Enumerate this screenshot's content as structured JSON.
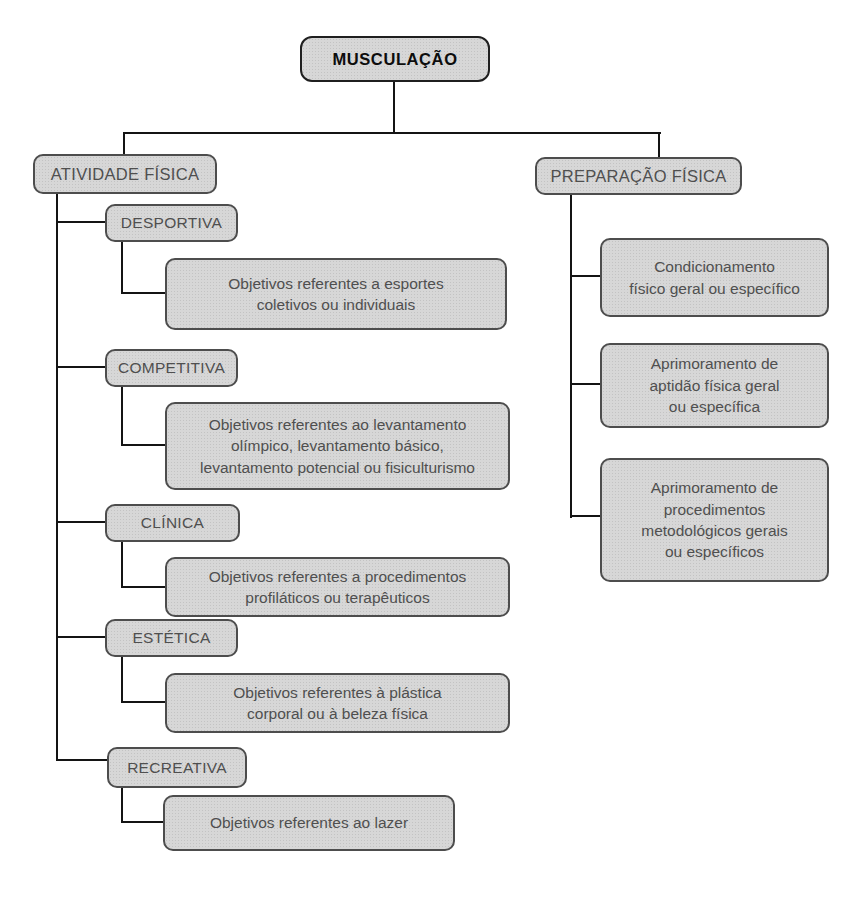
{
  "colors": {
    "box_fill": "#d7d7d7",
    "box_border": "#4d4d4d",
    "root_border": "#1f1f1f",
    "connector_line": "#141414",
    "text": "#4f4f4f",
    "root_text": "#0d0d0d"
  },
  "diagram": {
    "root": {
      "label": "MUSCULAÇÃO"
    },
    "branches": [
      {
        "label": "ATIVIDADE FÍSICA",
        "children": [
          {
            "label": "DESPORTIVA",
            "description": "Objetivos referentes a esportes\ncoletivos ou individuais"
          },
          {
            "label": "COMPETITIVA",
            "description": "Objetivos referentes ao levantamento\nolímpico, levantamento básico,\nlevantamento potencial ou fisiculturismo"
          },
          {
            "label": "CLÍNICA",
            "description": "Objetivos referentes a procedimentos\nprofiláticos ou terapêuticos"
          },
          {
            "label": "ESTÉTICA",
            "description": "Objetivos referentes à plástica\ncorporal ou à beleza física"
          },
          {
            "label": "RECREATIVA",
            "description": "Objetivos referentes ao lazer"
          }
        ]
      },
      {
        "label": "PREPARAÇÃO FÍSICA",
        "children": [
          {
            "label": "Condicionamento\nfísico geral ou específico"
          },
          {
            "label": "Aprimoramento de\naptidão física geral\nou específica"
          },
          {
            "label": "Aprimoramento de\nprocedimentos\nmetodológicos gerais\nou específicos"
          }
        ]
      }
    ]
  }
}
